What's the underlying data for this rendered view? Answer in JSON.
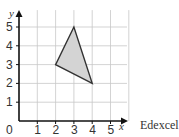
{
  "chart_data": {
    "type": "scatter",
    "title": "",
    "xlabel": "x",
    "ylabel": "y",
    "xlim": [
      0,
      6
    ],
    "ylim": [
      0,
      6
    ],
    "grid": true,
    "x_ticks": [
      "0",
      "1",
      "2",
      "3",
      "4",
      "5"
    ],
    "y_ticks": [
      "1",
      "2",
      "3",
      "4",
      "5"
    ],
    "shape": {
      "kind": "triangle",
      "vertices": [
        [
          3,
          5
        ],
        [
          2,
          3
        ],
        [
          4,
          2
        ]
      ],
      "fill": "#d4d4d4",
      "stroke": "#333333"
    }
  },
  "source_label": "Edexcel"
}
